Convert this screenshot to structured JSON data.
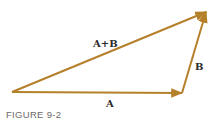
{
  "diagram": {
    "type": "vector-addition",
    "vectors": [
      {
        "name": "A",
        "label": "A",
        "from": "origin",
        "to": "tip-A"
      },
      {
        "name": "B",
        "label": "B",
        "from": "tip-A",
        "to": "tip-B"
      },
      {
        "name": "A+B",
        "label": "A+B",
        "from": "origin",
        "to": "tip-B"
      }
    ],
    "color": "#b5802a"
  },
  "labels": {
    "a": "A",
    "b": "B",
    "sum": "A+B"
  },
  "caption": "FIGURE 9-2"
}
